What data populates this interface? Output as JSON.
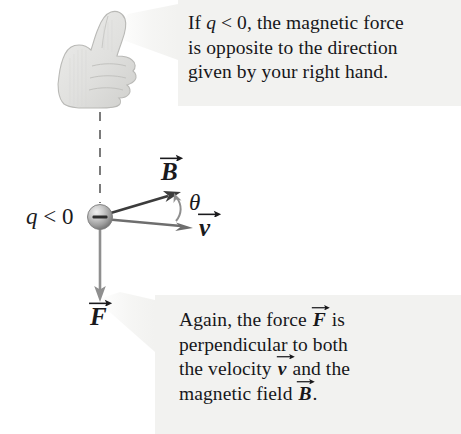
{
  "figure": {
    "background_color": "#ffffff",
    "width": 461,
    "height": 434
  },
  "callouts": {
    "top": {
      "name": "negative-charge-note",
      "background_color": "#f2f2f0",
      "text_color": "#17171a",
      "lines": [
        "If q < 0, the magnetic force",
        "is opposite to the direction",
        "given by your right hand."
      ],
      "line1_pre": "If ",
      "line1_var": "q",
      "line1_post": " < 0, the magnetic force",
      "line2": "is opposite to the direction",
      "line3": "given by your right hand."
    },
    "bottom": {
      "name": "perpendicularity-note",
      "background_color": "#f2f2f0",
      "text_color": "#17171a",
      "lines": [
        "Again, the force F is",
        "perpendicular to both",
        "the velocity v and the",
        "magnetic field B."
      ],
      "line1_pre": "Again, the force ",
      "line1_vec": "F",
      "line1_post": " is",
      "line2": "perpendicular to both",
      "line3_pre": "the velocity ",
      "line3_vec": "v",
      "line3_post": " and the",
      "line4_pre": "magnetic field ",
      "line4_vec": "B",
      "line4_post": "."
    }
  },
  "diagram": {
    "charge": {
      "label_pre": "q",
      "label_post": " < 0",
      "sign": "−",
      "center_x": 100,
      "center_y": 217,
      "radius": 12,
      "color": "#9a9a9a"
    },
    "hand": {
      "name": "right-hand-thumbs-up",
      "color": "#e3e3e1",
      "outline_color": "#b9b9b6"
    },
    "dashed_line": {
      "name": "thumb-direction-dashed-line",
      "x": 100,
      "y_top": 112,
      "y_bottom": 203,
      "color": "#5a5a5a"
    },
    "vectors": [
      {
        "name": "magnetic-field-vector",
        "symbol": "B",
        "x1": 100,
        "y1": 217,
        "x2": 179,
        "y2": 193,
        "color": "#3c3c3c",
        "label_x": 160,
        "label_y": 158
      },
      {
        "name": "velocity-vector",
        "symbol": "v",
        "x1": 100,
        "y1": 217,
        "x2": 192,
        "y2": 228,
        "color": "#6e6e6e",
        "label_x": 198,
        "label_y": 214
      },
      {
        "name": "force-vector",
        "symbol": "F",
        "x1": 100,
        "y1": 229,
        "x2": 100,
        "y2": 300,
        "color": "#8c8c8c",
        "label_x": 89,
        "label_y": 303
      }
    ],
    "angle": {
      "name": "angle-theta",
      "symbol": "θ",
      "between": [
        "velocity-vector",
        "magnetic-field-vector"
      ],
      "label_x": 189,
      "label_y": 190,
      "color": "#8c8c8c"
    }
  }
}
